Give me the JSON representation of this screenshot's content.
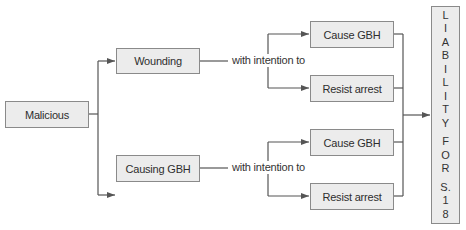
{
  "diagram": {
    "root": {
      "label": "Malicious"
    },
    "branches": [
      {
        "label": "Wounding",
        "connector": "with intention to",
        "outcomes": [
          {
            "label": "Cause GBH"
          },
          {
            "label": "Resist arrest"
          }
        ]
      },
      {
        "label": "Causing GBH",
        "connector": "with intention to",
        "outcomes": [
          {
            "label": "Cause GBH"
          },
          {
            "label": "Resist arrest"
          }
        ]
      }
    ],
    "result": {
      "label": "LIABILITY FOR S. 18",
      "letters": [
        "L",
        "I",
        "A",
        "B",
        "I",
        "L",
        "I",
        "T",
        "Y",
        "F",
        "O",
        "R",
        "S.",
        "1",
        "8"
      ]
    }
  },
  "colors": {
    "box_fill": "#ececec",
    "box_border": "#8a8a8a",
    "line": "#555555"
  }
}
